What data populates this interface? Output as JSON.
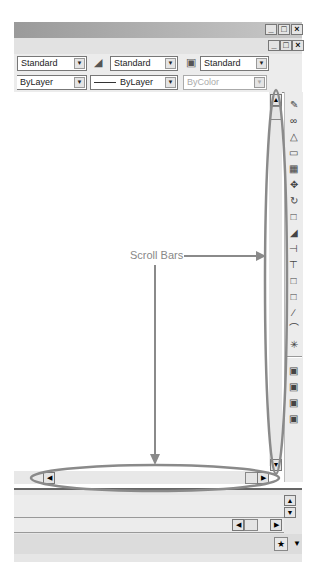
{
  "window": {
    "titlebar_buttons": [
      "_",
      "□",
      "×"
    ],
    "doc_buttons": [
      "_",
      "□",
      "×"
    ]
  },
  "styles_toolbar": {
    "text_style": "Standard",
    "dim_style": "Standard",
    "plot_style": "Standard"
  },
  "properties_toolbar": {
    "layer": "ByLayer",
    "linetype": "ByLayer",
    "color": "ByColor"
  },
  "annotation": {
    "label": "Scroll Bars",
    "color": "#8a8a8a"
  },
  "modify_toolbar_icons": [
    "erase",
    "copy",
    "mirror",
    "offset",
    "array",
    "move",
    "rotate",
    "scale",
    "stretch",
    "trim",
    "extend",
    "break",
    "join",
    "chamfer",
    "fillet",
    "explode"
  ],
  "draw_order_icons": [
    "draw-order-1",
    "draw-order-2",
    "draw-order-3",
    "draw-order-4"
  ],
  "status": {
    "tray_icon": "communication-center-icon"
  }
}
